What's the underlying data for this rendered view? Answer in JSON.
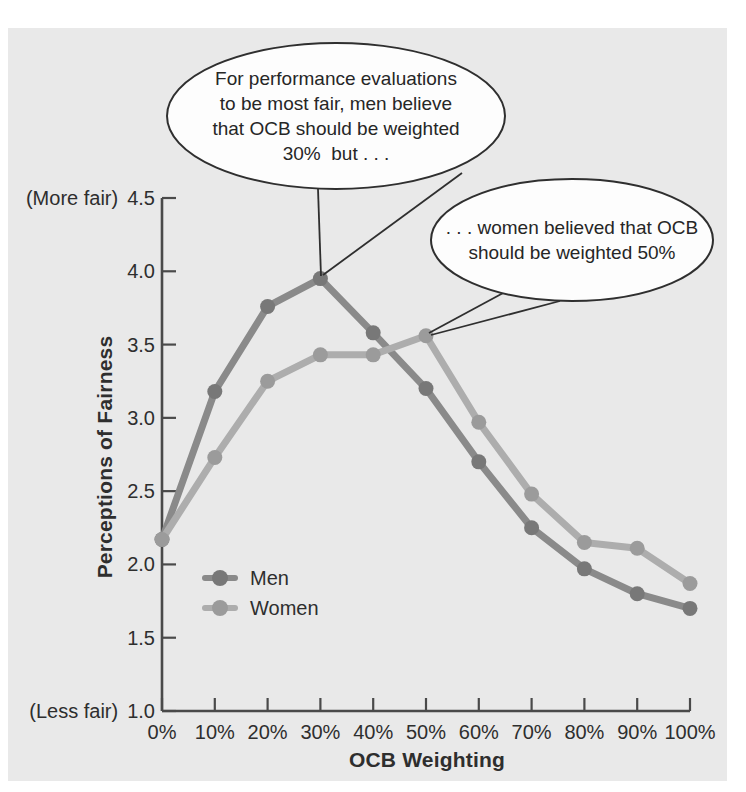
{
  "figure": {
    "background_color": "#ffffff",
    "panel_color": "#e9e9e9",
    "axis_color": "#4a4a4a",
    "text_color": "#2e2e2e",
    "bubble_fill": "#fdfdfd",
    "bubble_stroke": "#2f2f2f"
  },
  "chart_data": {
    "type": "line",
    "title": "",
    "xlabel": "OCB Weighting",
    "ylabel": "Perceptions of Fairness",
    "categories": [
      "0%",
      "10%",
      "20%",
      "30%",
      "40%",
      "50%",
      "60%",
      "70%",
      "80%",
      "90%",
      "100%"
    ],
    "x_values": [
      0,
      10,
      20,
      30,
      40,
      50,
      60,
      70,
      80,
      90,
      100
    ],
    "xlim": [
      0,
      100
    ],
    "ylim": [
      1.0,
      4.5
    ],
    "y_ticks": [
      "4.5",
      "4.0",
      "3.5",
      "3.0",
      "2.5",
      "2.0",
      "1.5",
      "1.0"
    ],
    "y_tick_values": [
      4.5,
      4.0,
      3.5,
      3.0,
      2.5,
      2.0,
      1.5,
      1.0
    ],
    "y_top_note": "(More fair)",
    "y_bottom_note": "(Less fair)",
    "grid": false,
    "legend_position": "inside lower-left",
    "series": [
      {
        "name": "Men",
        "color": "#8a8a8a",
        "marker_color": "#787878",
        "values": [
          2.17,
          3.18,
          3.76,
          3.95,
          3.58,
          3.2,
          2.7,
          2.25,
          1.97,
          1.8,
          1.7
        ]
      },
      {
        "name": "Women",
        "color": "#adadad",
        "marker_color": "#9b9b9b",
        "values": [
          2.17,
          2.73,
          3.25,
          3.43,
          3.43,
          3.56,
          2.97,
          2.48,
          2.15,
          2.11,
          1.87
        ]
      }
    ]
  },
  "annotations": {
    "men_callout": "For performance evaluations\nto be most fair, men believe\nthat OCB should be weighted\n30%  but . . .",
    "women_callout": ". . . women believed that OCB\nshould be weighted 50%"
  }
}
